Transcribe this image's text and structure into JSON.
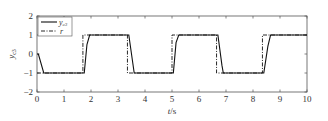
{
  "chart_data": {
    "type": "line",
    "title": "",
    "xlabel": "t/s",
    "ylabel": "y_c3",
    "xlim": [
      0,
      10
    ],
    "ylim": [
      -2,
      2
    ],
    "xticks": [
      "0",
      "1",
      "2",
      "3",
      "4",
      "5",
      "6",
      "7",
      "8",
      "9",
      "10"
    ],
    "yticks": [
      "2",
      "1",
      "0",
      "-1",
      "-2"
    ],
    "grid": false,
    "legend_position": "upper left",
    "series": [
      {
        "name": "y_c3",
        "style": "solid",
        "x": [
          0,
          0.05,
          0.25,
          1.75,
          1.85,
          1.95,
          3.4,
          3.55,
          3.6,
          5.05,
          5.15,
          5.25,
          6.7,
          6.85,
          6.9,
          8.4,
          8.55,
          8.65,
          10
        ],
        "y": [
          0,
          0,
          -1,
          -1,
          0.5,
          1,
          1,
          -0.5,
          -1,
          -1,
          0.6,
          1,
          1,
          -0.6,
          -1,
          -1,
          0.4,
          1,
          1
        ]
      },
      {
        "name": "r",
        "style": "dash-dot",
        "x": [
          0,
          0,
          1.7,
          1.7,
          3.35,
          3.35,
          5.0,
          5.0,
          6.65,
          6.65,
          8.35,
          8.35,
          10
        ],
        "y": [
          -1,
          -1,
          -1,
          1,
          1,
          -1,
          -1,
          1,
          1,
          -1,
          -1,
          1,
          1
        ]
      }
    ]
  },
  "legend": {
    "items": [
      "y_c3",
      "r"
    ]
  },
  "axis": {
    "xlabel_t": "t",
    "xlabel_s": "/s",
    "ylabel_main": "y",
    "ylabel_sub": "c3"
  }
}
